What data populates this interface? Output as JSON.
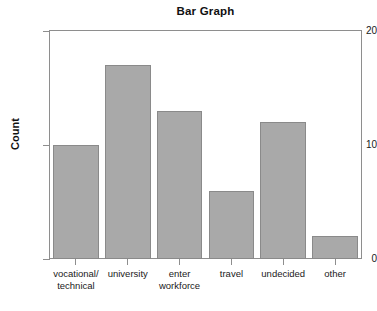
{
  "chart_data": {
    "type": "bar",
    "title": "Bar Graph",
    "xlabel": "",
    "ylabel": "Count",
    "categories": [
      "vocational/ technical",
      "university",
      "enter workforce",
      "travel",
      "undecided",
      "other"
    ],
    "category_lines": [
      [
        "vocational/",
        "technical"
      ],
      [
        "university",
        ""
      ],
      [
        "enter",
        "workforce"
      ],
      [
        "travel",
        ""
      ],
      [
        "undecided",
        ""
      ],
      [
        "other",
        ""
      ]
    ],
    "values": [
      10,
      17,
      13,
      6,
      12,
      2
    ],
    "ylim": [
      0,
      20
    ],
    "ytick_labels": [
      "0",
      "10",
      "20"
    ],
    "ytick_values": [
      0,
      10,
      20
    ],
    "grid": false,
    "legend": false,
    "bar_color": "#a9a9a9",
    "bar_edge_color": "#8a8a8a",
    "axis_color": "#8e8e8e",
    "text_color": "#1a1a1a"
  }
}
